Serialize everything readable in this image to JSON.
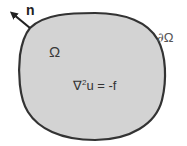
{
  "diagram": {
    "domain_label": "Ω",
    "boundary_label": {
      "symbol": "∂",
      "name": "Ω"
    },
    "normal_label": "n",
    "equation": {
      "operator": "∇",
      "exponent": "2",
      "rest": "u = -f"
    },
    "colors": {
      "fill": "#d3d3d3",
      "stroke": "#333333",
      "text": "#3a3a3a",
      "background": "#ffffff"
    },
    "elements": [
      {
        "id": "region",
        "type": "closed-blob",
        "label": "Ω"
      },
      {
        "id": "boundary",
        "type": "curve",
        "label": "∂Ω"
      },
      {
        "id": "normal-vector",
        "type": "arrow",
        "label": "n",
        "direction": "outward up-left"
      }
    ]
  }
}
